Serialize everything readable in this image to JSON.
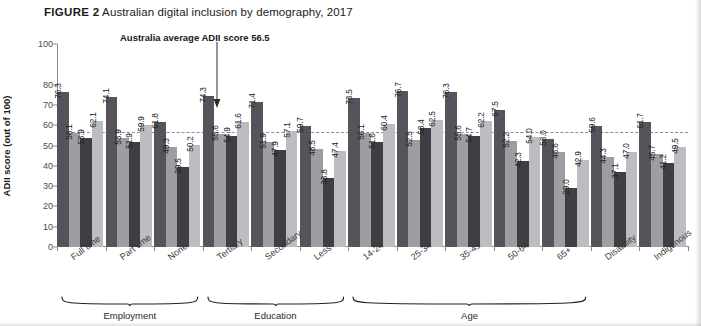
{
  "figure": {
    "label": "FIGURE 2",
    "title": "Australian digital inclusion by demography, 2017"
  },
  "annotation": {
    "average_note": "Australia average ADII score 56.5",
    "average_value": 56.5
  },
  "axis": {
    "ylabel": "ADII score (out of 100)",
    "yticks": [
      "0",
      "10",
      "20",
      "30",
      "40",
      "50",
      "60",
      "70",
      "80",
      "100"
    ]
  },
  "sections": [
    {
      "label": "Employment",
      "categories": [
        "Full time",
        "Part time",
        "None"
      ]
    },
    {
      "label": "Education",
      "categories": [
        "Tertiary",
        "Secondary",
        "Less"
      ]
    },
    {
      "label": "Age",
      "categories": [
        "14-24",
        "25-34",
        "35-49",
        "50-64",
        "65+"
      ]
    },
    {
      "label": "",
      "categories": [
        "Disability"
      ]
    },
    {
      "label": "",
      "categories": [
        "Indigenous"
      ]
    }
  ],
  "colors": {
    "series0": "#54545a",
    "series1": "#9d9da2",
    "series2": "#3e3e44",
    "series3": "#bdbdc1",
    "average_line": "#8d8d8d"
  },
  "chart_data": {
    "type": "bar",
    "title": "Australian digital inclusion by demography, 2017",
    "xlabel": "",
    "ylabel": "ADII score (out of 100)",
    "ylim": [
      0,
      100
    ],
    "ytick_step": 10,
    "grid": false,
    "legend_position": "none",
    "annotations": [
      {
        "text": "Australia average ADII score 56.5",
        "value": 56.5,
        "type": "reference-line"
      }
    ],
    "categories": [
      "Full time",
      "Part time",
      "None",
      "Tertiary",
      "Secondary",
      "Less",
      "14-24",
      "25-34",
      "35-49",
      "50-64",
      "65+",
      "Disability",
      "Indigenous"
    ],
    "series": [
      {
        "name": "series1",
        "values": [
          76.3,
          74.1,
          61.8,
          74.3,
          71.4,
          59.7,
          73.5,
          76.7,
          76.3,
          67.5,
          53.0,
          59.6,
          61.7
        ]
      },
      {
        "name": "series2",
        "values": [
          56.1,
          53.9,
          49.3,
          55.6,
          51.9,
          48.5,
          56.1,
          52.5,
          55.6,
          52.2,
          46.6,
          44.3,
          45.7
        ]
      },
      {
        "name": "series3",
        "values": [
          53.9,
          51.9,
          39.5,
          54.9,
          47.9,
          33.8,
          51.6,
          58.4,
          54.7,
          42.3,
          29.0,
          37.1,
          41.2
        ]
      },
      {
        "name": "series4",
        "values": [
          62.1,
          59.9,
          50.2,
          61.6,
          57.1,
          47.4,
          60.4,
          62.5,
          62.2,
          54.0,
          42.9,
          47.0,
          49.5
        ]
      }
    ]
  }
}
